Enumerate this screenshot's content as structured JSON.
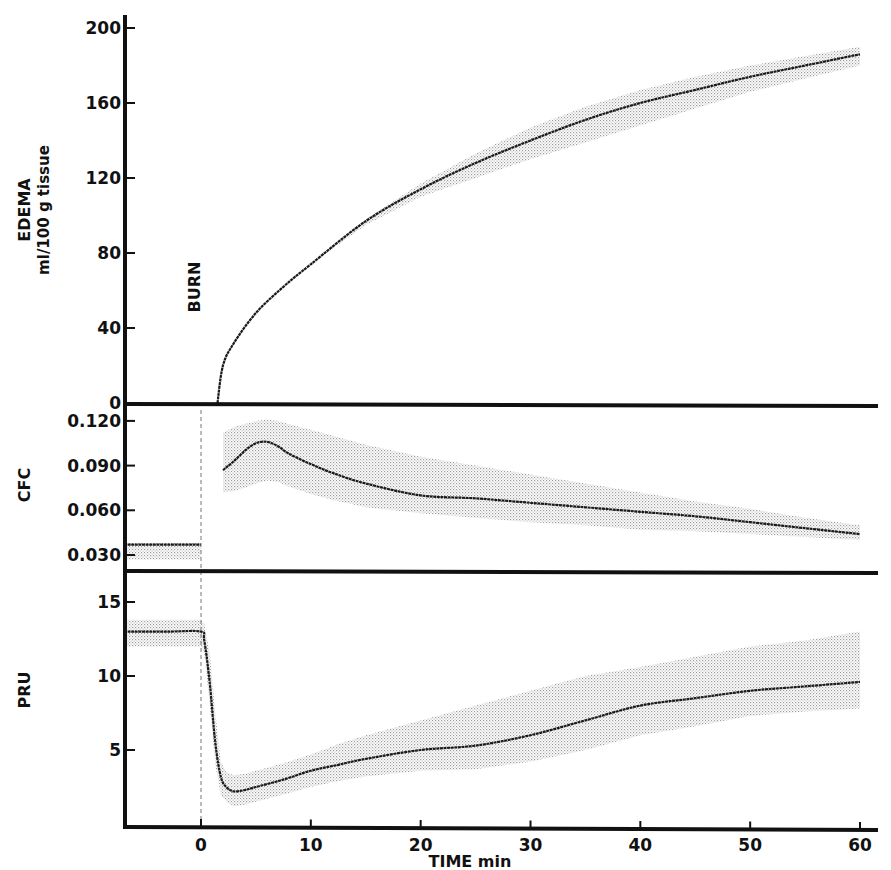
{
  "figure": {
    "x_axis_title": "TIME min",
    "annotation": "BURN"
  },
  "chart_data": [
    {
      "type": "line",
      "panel": "top",
      "title": "",
      "ylabel": "EDEMA",
      "ylabel_units": "ml/100 g tissue",
      "xlabel": "TIME min",
      "xlim": [
        -7,
        62
      ],
      "ylim": [
        0,
        205
      ],
      "xticks": [
        0,
        10,
        20,
        30,
        40,
        50,
        60
      ],
      "yticks": [
        0,
        40,
        80,
        120,
        160,
        200
      ],
      "ytick_labels": [
        "0",
        "40",
        "80",
        "120",
        "160",
        "200"
      ],
      "grid": false,
      "shaded_band": true,
      "annotation": {
        "text": "BURN",
        "x": 0
      },
      "series": [
        {
          "name": "Edema mean",
          "x": [
            1.5,
            2,
            3,
            5,
            7.5,
            10,
            15,
            20,
            25,
            30,
            35,
            40,
            45,
            50,
            55,
            60
          ],
          "values": [
            0,
            20,
            32,
            48,
            62,
            74,
            97,
            114,
            128,
            140,
            151,
            160,
            167,
            174,
            180,
            186
          ],
          "band_upper": [
            0,
            20,
            32,
            48,
            62,
            74,
            98,
            117,
            133,
            147,
            158,
            167,
            174,
            180,
            185,
            190
          ],
          "band_lower": [
            0,
            20,
            32,
            48,
            62,
            74,
            95,
            110,
            120,
            130,
            139,
            148,
            157,
            166,
            173,
            180
          ]
        }
      ]
    },
    {
      "type": "line",
      "panel": "middle",
      "ylabel": "CFC",
      "xlim": [
        -7,
        62
      ],
      "ylim": [
        0.018,
        0.128
      ],
      "yticks": [
        0.03,
        0.06,
        0.09,
        0.12
      ],
      "ytick_labels": [
        "0.030",
        "0.060",
        "0.090",
        "0.120"
      ],
      "grid": false,
      "shaded_band": true,
      "series": [
        {
          "name": "CFC baseline",
          "x": [
            -7,
            0
          ],
          "values": [
            0.037,
            0.037
          ],
          "band_upper": [
            0.038,
            0.038
          ],
          "band_lower": [
            0.027,
            0.027
          ]
        },
        {
          "name": "CFC mean",
          "x": [
            2,
            3,
            4,
            5,
            6,
            7,
            8,
            10,
            12,
            15,
            20,
            25,
            30,
            35,
            40,
            45,
            50,
            55,
            60
          ],
          "values": [
            0.087,
            0.093,
            0.1,
            0.105,
            0.106,
            0.103,
            0.098,
            0.091,
            0.085,
            0.078,
            0.07,
            0.068,
            0.065,
            0.062,
            0.059,
            0.056,
            0.052,
            0.048,
            0.044
          ],
          "band_upper": [
            0.112,
            0.116,
            0.118,
            0.12,
            0.121,
            0.12,
            0.118,
            0.114,
            0.11,
            0.104,
            0.096,
            0.09,
            0.084,
            0.078,
            0.072,
            0.066,
            0.061,
            0.055,
            0.05
          ],
          "band_lower": [
            0.072,
            0.073,
            0.075,
            0.078,
            0.08,
            0.079,
            0.076,
            0.071,
            0.067,
            0.062,
            0.058,
            0.055,
            0.052,
            0.05,
            0.047,
            0.046,
            0.044,
            0.042,
            0.04
          ]
        }
      ]
    },
    {
      "type": "line",
      "panel": "bottom",
      "ylabel": "PRU",
      "xlabel": "TIME min",
      "xlim": [
        -7,
        62
      ],
      "ylim": [
        0,
        17
      ],
      "xticks": [
        0,
        10,
        20,
        30,
        40,
        50,
        60
      ],
      "xtick_labels": [
        "0",
        "10",
        "20",
        "30",
        "40",
        "50",
        "60"
      ],
      "yticks": [
        5,
        10,
        15
      ],
      "ytick_labels": [
        "5",
        "10",
        "15"
      ],
      "grid": false,
      "shaded_band": true,
      "series": [
        {
          "name": "PRU mean",
          "x": [
            -7,
            -3,
            0,
            0.3,
            0.8,
            1.3,
            1.8,
            2.3,
            3,
            4,
            5,
            7.5,
            10,
            12.5,
            15,
            20,
            25,
            30,
            35,
            40,
            45,
            50,
            55,
            60
          ],
          "values": [
            13,
            13,
            13,
            12.4,
            9.5,
            5.5,
            3.2,
            2.5,
            2.2,
            2.3,
            2.5,
            3.0,
            3.6,
            4.0,
            4.4,
            5.0,
            5.3,
            6.0,
            7.0,
            8.0,
            8.5,
            9.0,
            9.3,
            9.6
          ],
          "band_upper": [
            13.8,
            13.8,
            13.8,
            13.5,
            11.5,
            7.5,
            4.2,
            3.5,
            3.3,
            3.4,
            3.6,
            4.1,
            4.7,
            5.4,
            6.0,
            7.0,
            8.0,
            9.0,
            10.0,
            10.6,
            11.3,
            12.0,
            12.4,
            13.0
          ],
          "band_lower": [
            12.0,
            12.0,
            12.0,
            11.5,
            8.0,
            4.0,
            2.0,
            1.5,
            1.2,
            1.3,
            1.5,
            2.0,
            2.5,
            2.9,
            3.2,
            3.6,
            3.7,
            4.2,
            5.0,
            6.0,
            6.6,
            7.3,
            7.6,
            7.8
          ]
        }
      ]
    }
  ]
}
